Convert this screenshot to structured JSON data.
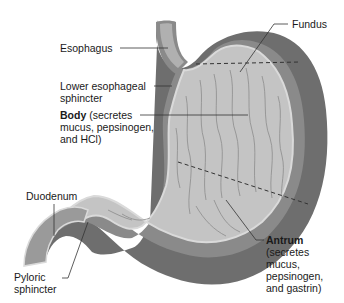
{
  "diagram": {
    "colors": {
      "outer_wall": "#6e6e6e",
      "muscle_layer": "#8a8a8a",
      "mucosa": "#c4c4c4",
      "mucosa_edge": "#dadada",
      "fold_lines": "#8c8c8c",
      "leader_lines": "#333333",
      "region_divider": "#333333"
    },
    "labels": {
      "fundus": "Fundus",
      "esophagus": "Esophagus",
      "les_line1": "Lower esophageal",
      "les_line2": "sphincter",
      "body_bold": "Body",
      "body_line1_rest": " (secretes",
      "body_line2": "mucus, pepsinogen,",
      "body_line3": "and HCl)",
      "duodenum": "Duodenum",
      "pyloric_line1": "Pyloric",
      "pyloric_line2": "sphincter",
      "antrum_bold": "Antrum",
      "antrum_line2": "(secretes",
      "antrum_line3": "mucus,",
      "antrum_line4": "pepsinogen,",
      "antrum_line5": "and gastrin)"
    }
  }
}
